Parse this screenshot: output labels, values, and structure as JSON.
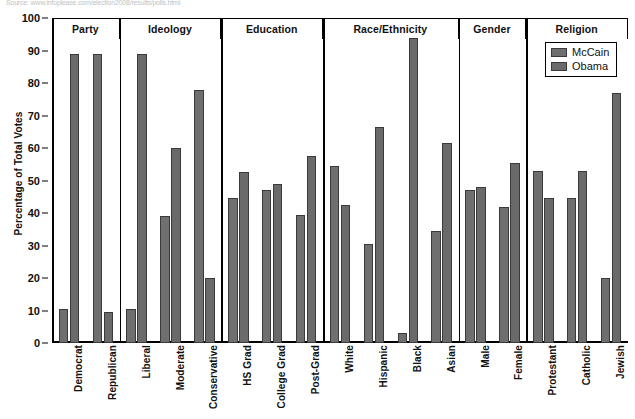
{
  "source_note": "Source: www.infoplease.com/election2008/results/polls.html",
  "chart_data": {
    "type": "bar",
    "title": "",
    "xlabel": "",
    "ylabel": "Percentage of Total Votes",
    "ylim": [
      0,
      100
    ],
    "ytick_step": 10,
    "yticks": [
      0,
      10,
      20,
      30,
      40,
      50,
      60,
      70,
      80,
      90,
      100
    ],
    "grid": false,
    "legend_position": "top-right",
    "series": [
      {
        "name": "McCain",
        "color": "#6f6f6f",
        "values": [
          10.5,
          89,
          10.5,
          39,
          78,
          44.5,
          47,
          39.5,
          54.5,
          30.5,
          3,
          34.5,
          47,
          42,
          53,
          44.5,
          20
        ]
      },
      {
        "name": "Obama",
        "color": "#6a6a6a",
        "values": [
          89,
          9.5,
          89,
          60,
          20,
          52.5,
          49,
          57.5,
          42.5,
          66.5,
          94,
          61.5,
          48,
          55.5,
          44.5,
          53,
          77
        ]
      }
    ],
    "categories": [
      "Democrat",
      "Republican",
      "Liberal",
      "Moderate",
      "Conservative",
      "HS Grad",
      "College Grad",
      "Post-Grad",
      "White",
      "Hispanic",
      "Black",
      "Asian",
      "Male",
      "Female",
      "Protestant",
      "Catholic",
      "Jewish"
    ],
    "groups": [
      {
        "label": "Party",
        "count": 2
      },
      {
        "label": "Ideology",
        "count": 3
      },
      {
        "label": "Education",
        "count": 3
      },
      {
        "label": "Race/Ethnicity",
        "count": 4
      },
      {
        "label": "Gender",
        "count": 2
      },
      {
        "label": "Religion",
        "count": 3
      }
    ]
  }
}
